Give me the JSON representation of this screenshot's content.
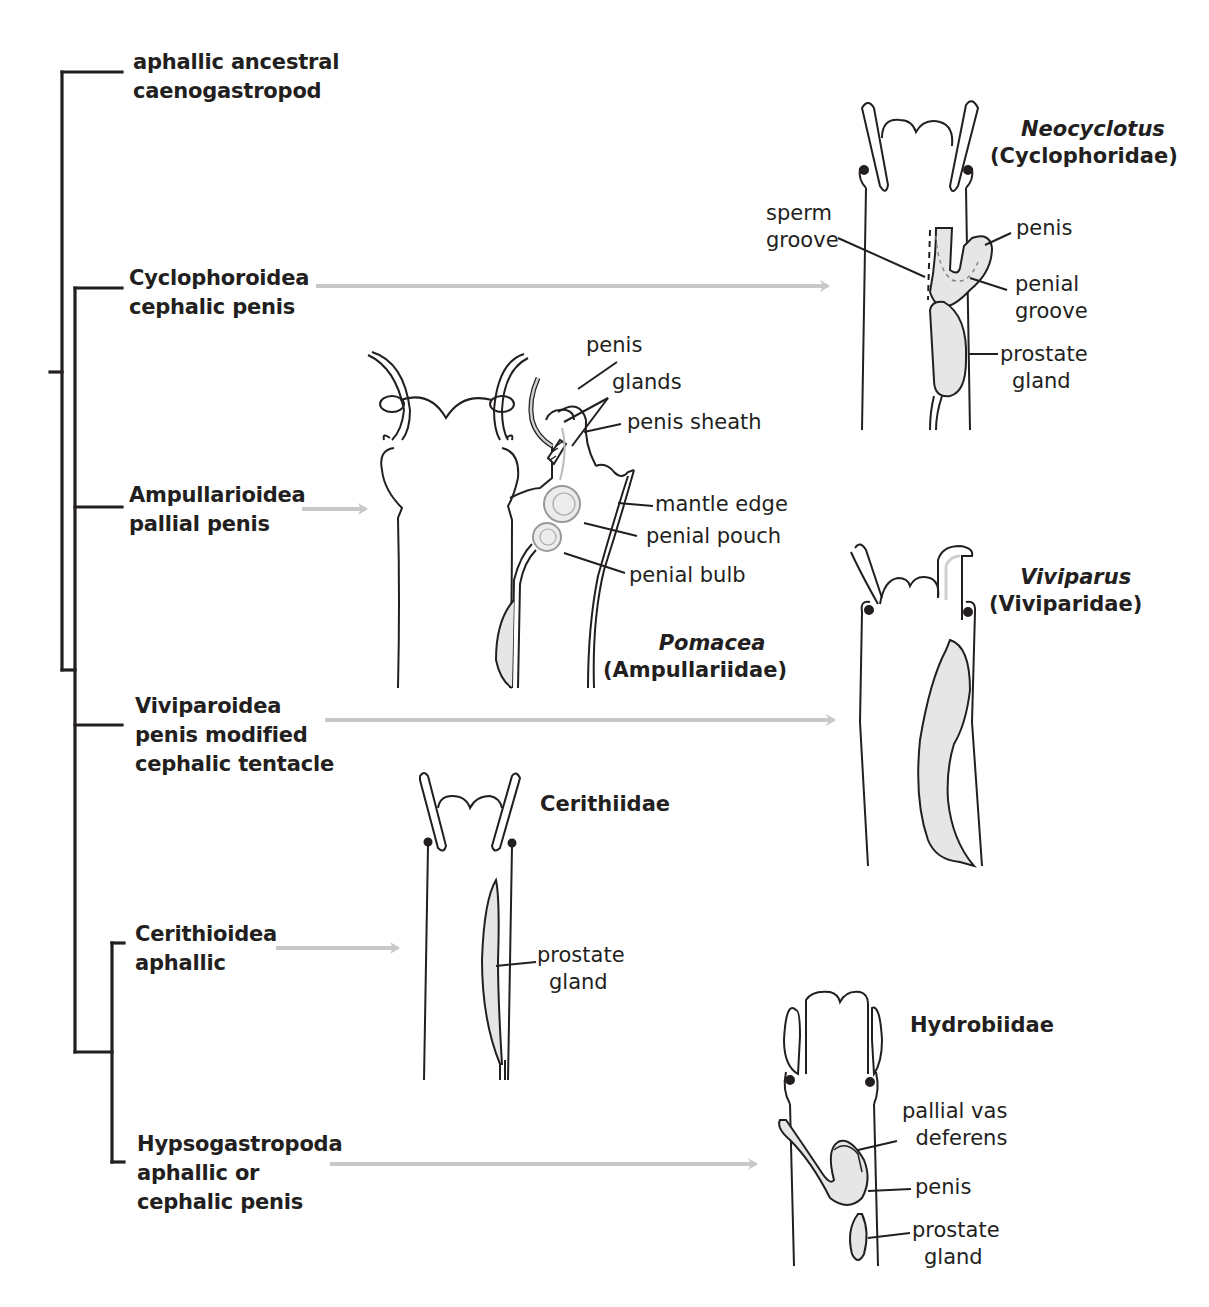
{
  "colors": {
    "ink": "#231f20",
    "arrow": "#c8c8c8",
    "gland_fill": "#e6e6e6",
    "background": "#ffffff"
  },
  "tree": {
    "clades": [
      {
        "id": "ancestral",
        "lines": [
          "aphallic ancestral",
          "caenogastropod"
        ]
      },
      {
        "id": "cyclophoroidea",
        "lines": [
          "Cyclophoroidea",
          "cephalic penis"
        ]
      },
      {
        "id": "ampullarioidea",
        "lines": [
          "Ampullarioidea",
          "pallial penis"
        ]
      },
      {
        "id": "viviparoidea",
        "lines": [
          "Viviparoidea",
          "penis modified",
          "cephalic tentacle"
        ]
      },
      {
        "id": "cerithioidea",
        "lines": [
          "Cerithioidea",
          "aphallic"
        ]
      },
      {
        "id": "hypsogastropoda",
        "lines": [
          "Hypsogastropoda",
          "aphallic or",
          "cephalic penis"
        ]
      }
    ]
  },
  "panels": {
    "neocyclotus": {
      "genus": "Neocyclotus",
      "family": "(Cyclophoridae)",
      "labels": {
        "sperm_groove": [
          "sperm",
          "groove"
        ],
        "penis": "penis",
        "penial_groove": [
          "penial",
          "groove"
        ],
        "prostate_gland": [
          "prostate",
          "gland"
        ]
      }
    },
    "pomacea": {
      "genus": "Pomacea",
      "family": "(Ampullariidae)",
      "labels": {
        "penis": "penis",
        "glands": "glands",
        "penis_sheath": "penis sheath",
        "mantle_edge": "mantle edge",
        "penial_pouch": "penial pouch",
        "penial_bulb": "penial bulb"
      }
    },
    "viviparus": {
      "genus": "Viviparus",
      "family": "(Viviparidae)"
    },
    "cerithiidae": {
      "family": "Cerithiidae",
      "labels": {
        "prostate_gland": [
          "prostate",
          "gland"
        ]
      }
    },
    "hydrobiidae": {
      "family": "Hydrobiidae",
      "labels": {
        "pallial_vas_deferens": [
          "pallial vas",
          "deferens"
        ],
        "penis": "penis",
        "prostate_gland": [
          "prostate",
          "gland"
        ]
      }
    }
  }
}
